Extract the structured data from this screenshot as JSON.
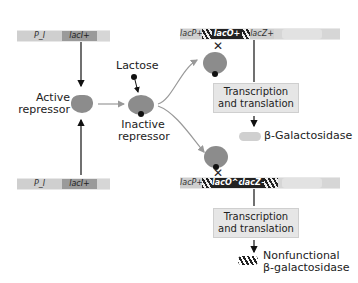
{
  "top_left_gene": {
    "promoter": "P_I",
    "gene": "lacI+"
  },
  "bottom_left_gene": {
    "promoter": "P_I",
    "gene": "lacI+"
  },
  "active_repressor_label": "Active repressor",
  "lactose_label": "Lactose",
  "inactive_repressor_label": "Inactive repressor",
  "top_right_operon": {
    "promoter": "lacP+",
    "operator": "lacO+",
    "gene": "lacZ+"
  },
  "bottom_right_operon": {
    "promoter": "lacP+",
    "operator": "lacO^c",
    "gene": "lacZ−"
  },
  "top_process_box": "Transcription and translation",
  "bottom_process_box": "Transcription and translation",
  "top_product": "β-Galactosidase",
  "bottom_product": "Nonfunctional β-galactosidase",
  "blocked_symbol": "✕",
  "colors": {
    "repressor": "#8c8c8c",
    "dark_segment": "#222222",
    "box_fill": "#e6e6e6",
    "bar_light": "#d6d6d6"
  }
}
